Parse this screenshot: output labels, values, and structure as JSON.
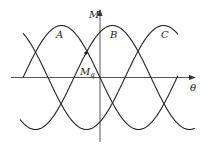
{
  "diagram": {
    "axes": {
      "vertical_label": "M",
      "horizontal_label": "θ",
      "point_label_main": "M",
      "point_label_sub": "q"
    },
    "curves": [
      {
        "name": "A",
        "label": "A",
        "phase_start_x": 23,
        "x_range": [
          23,
          178
        ]
      },
      {
        "name": "B",
        "label": "B",
        "phase_start_x": 74,
        "x_range": [
          20,
          195
        ]
      },
      {
        "name": "C",
        "label": "C",
        "phase_start_x": 125,
        "x_range": [
          23,
          178
        ]
      }
    ],
    "geometry": {
      "baseline_y": 77.5,
      "amplitude": 52,
      "period": 154,
      "origin_x": 100
    },
    "colors": {
      "stroke": "#222222",
      "background": "#ffffff"
    }
  }
}
